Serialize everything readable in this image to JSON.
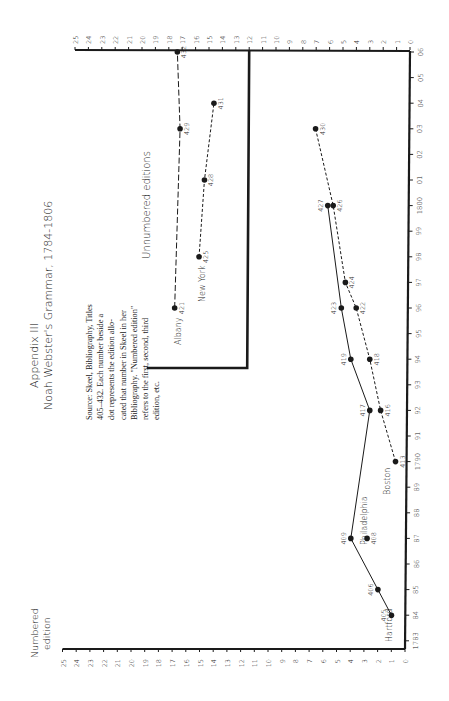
{
  "chart_data": {
    "type": "line",
    "title": "Appendix III",
    "subtitle": "Noah Webster's Grammar, 1784-1806",
    "orientation": "rotated 90° counter-clockwise (years along right edge, edition axis along bottom and top)",
    "xlabel": "Numbered edition",
    "ylabel": "Year",
    "edition_ticks": [
      0,
      1,
      2,
      3,
      4,
      5,
      6,
      7,
      8,
      9,
      10,
      11,
      12,
      13,
      14,
      15,
      16,
      17,
      18,
      19,
      20,
      21,
      22,
      23,
      24,
      25
    ],
    "edition_range": [
      0,
      25
    ],
    "year_ticks": [
      "1783",
      "84",
      "85",
      "86",
      "87",
      "88",
      "89",
      "1790",
      "91",
      "92",
      "93",
      "94",
      "95",
      "96",
      "97",
      "98",
      "99",
      "1800",
      "01",
      "02",
      "03",
      "04",
      "05",
      "06"
    ],
    "year_range": [
      1783,
      1806
    ],
    "note": "Source: Skeel, Bibliography, Titles 405–432. Each number beside a dot represents the edition allocated that number in Skeel in her Bibliography. \"Numbered edition\" refers to the first, second, third edition, etc.",
    "inset_label": "Unnumbered editions",
    "series": [
      {
        "name": "Hartford / Philadelphia (solid)",
        "style": "solid",
        "points": [
          {
            "label": "405",
            "year": 1784,
            "edition": 1
          },
          {
            "label": "406",
            "year": 1785,
            "edition": 2
          },
          {
            "label": "409",
            "year": 1787,
            "edition": 4
          },
          {
            "label": "417",
            "year": 1792,
            "edition": 2.6
          },
          {
            "label": "419",
            "year": 1794,
            "edition": 4
          },
          {
            "label": "423",
            "year": 1796,
            "edition": 4.7
          },
          {
            "label": "427",
            "year": 1800,
            "edition": 5.7
          }
        ]
      },
      {
        "name": "Philadelphia",
        "style": "point",
        "points": [
          {
            "label": "408",
            "year": 1787,
            "edition": 2.8
          }
        ]
      },
      {
        "name": "Boston (dashed)",
        "style": "dashed",
        "points": [
          {
            "label": "413",
            "year": 1790,
            "edition": 0.7
          },
          {
            "label": "416",
            "year": 1792,
            "edition": 1.8
          },
          {
            "label": "418",
            "year": 1794,
            "edition": 2.6
          },
          {
            "label": "422",
            "year": 1796,
            "edition": 3.6
          },
          {
            "label": "424",
            "year": 1797,
            "edition": 4.4
          },
          {
            "label": "426",
            "year": 1800,
            "edition": 5.3
          },
          {
            "label": "430",
            "year": 1803,
            "edition": 6.6
          }
        ]
      },
      {
        "name": "Albany (unnumbered)",
        "style": "long-dash",
        "points": [
          {
            "label": "421",
            "year": 1796,
            "edition": 17
          },
          {
            "label": "429",
            "year": 1803,
            "edition": 16.6
          },
          {
            "label": "432",
            "year": 1806,
            "edition": 16.8
          }
        ]
      },
      {
        "name": "New York (unnumbered)",
        "style": "dashed",
        "points": [
          {
            "label": "425",
            "year": 1798,
            "edition": 15.2
          },
          {
            "label": "428",
            "year": 1801,
            "edition": 14.8
          },
          {
            "label": "431",
            "year": 1804,
            "edition": 14.1
          }
        ]
      }
    ]
  },
  "labels": {
    "appendix": "Appendix III",
    "title": "Noah Webster's Grammar, 1784-1806",
    "axis_title_line1": "Numbered",
    "axis_title_line2": "edition",
    "source_lines": [
      "Source: Skeel, Bibliography, Titles",
      "405–432. Each number beside a",
      "dot represents the edition allo-",
      "cated that number in Skeel in her",
      "Bibliography. \"Numbered edition\"",
      "refers to the first, second, third",
      "edition, etc."
    ],
    "unnumbered": "Unnumbered editions",
    "cities": {
      "hartford": "Hartford",
      "philadelphia": "Philadelphia",
      "boston": "Boston",
      "albany": "Albany",
      "new_york": "New York"
    }
  },
  "colors": {
    "ink": "#1a1a1a",
    "background": "#ffffff"
  }
}
